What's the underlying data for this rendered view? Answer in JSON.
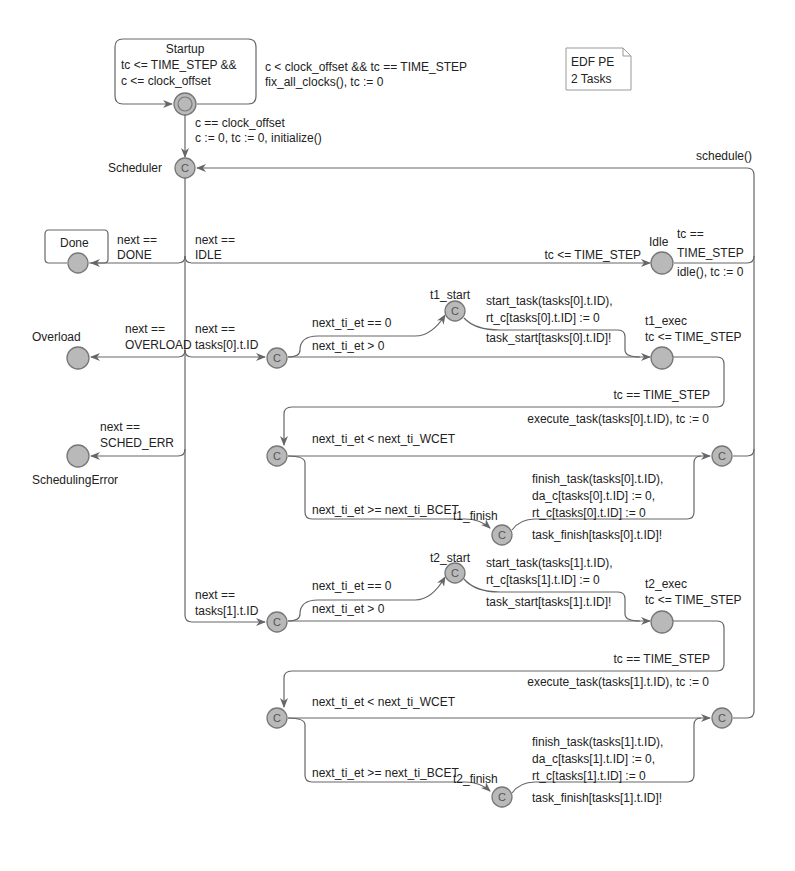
{
  "note": {
    "line1": "EDF PE",
    "line2": "2 Tasks"
  },
  "locations": {
    "startup": {
      "name": "Startup",
      "inv1": "tc <= TIME_STEP &&",
      "inv2": "c <= clock_offset"
    },
    "scheduler": {
      "name": "Scheduler",
      "mark": "C"
    },
    "done": {
      "name": "Done"
    },
    "idle": {
      "name": "Idle"
    },
    "overload": {
      "name": "Overload"
    },
    "sched_error": {
      "name": "SchedulingError"
    },
    "t1_start": {
      "name": "t1_start",
      "mark": "C"
    },
    "t1_exec": {
      "name": "t1_exec",
      "inv": "tc <= TIME_STEP"
    },
    "t1_finish": {
      "name": "t1_finish",
      "mark": "C"
    },
    "t2_start": {
      "name": "t2_start",
      "mark": "C"
    },
    "t2_exec": {
      "name": "t2_exec",
      "inv": "tc <= TIME_STEP"
    },
    "t2_finish": {
      "name": "t2_finish",
      "mark": "C"
    },
    "committed_mark": "C"
  },
  "edges": {
    "startup_self": {
      "guard": "c < clock_offset && tc == TIME_STEP",
      "update": "fix_all_clocks(), tc := 0"
    },
    "startup_to_sched": {
      "guard": "c == clock_offset",
      "update": "c := 0, tc := 0, initialize()"
    },
    "return_sched": {
      "update": "schedule()"
    },
    "to_done": {
      "g1": "next ==",
      "g2": "DONE"
    },
    "to_idle": {
      "g1": "next ==",
      "g2": "IDLE"
    },
    "idle_inv": "tc <= TIME_STEP",
    "idle_out": {
      "g1": "tc ==",
      "g2": "TIME_STEP",
      "update": "idle(), tc := 0"
    },
    "to_overload": {
      "g1": "next ==",
      "g2": "OVERLOAD"
    },
    "to_sched_err": {
      "g1": "next ==",
      "g2": "SCHED_ERR"
    },
    "task0": {
      "select": {
        "g1": "next ==",
        "g2": "tasks[0].t.ID"
      },
      "et_zero": "next_ti_et == 0",
      "et_pos": "next_ti_et > 0",
      "start_u1": "start_task(tasks[0].t.ID),",
      "start_u2": "rt_c[tasks[0].t.ID] := 0",
      "start_sync": "task_start[tasks[0].t.ID]!",
      "exec_guard": "tc == TIME_STEP",
      "exec_update": "execute_task(tasks[0].t.ID), tc := 0",
      "lt_wcet": "next_ti_et < next_ti_WCET",
      "ge_bcet": "next_ti_et >= next_ti_BCET",
      "fin_u1": "finish_task(tasks[0].t.ID),",
      "fin_u2": "da_c[tasks[0].t.ID] := 0,",
      "fin_u3": "rt_c[tasks[0].t.ID] := 0",
      "fin_sync": "task_finish[tasks[0].t.ID]!"
    },
    "task1": {
      "select": {
        "g1": "next ==",
        "g2": "tasks[1].t.ID"
      },
      "et_zero": "next_ti_et == 0",
      "et_pos": "next_ti_et > 0",
      "start_u1": "start_task(tasks[1].t.ID),",
      "start_u2": "rt_c[tasks[1].t.ID] := 0",
      "start_sync": "task_start[tasks[1].t.ID]!",
      "exec_guard": "tc == TIME_STEP",
      "exec_update": "execute_task(tasks[1].t.ID), tc := 0",
      "lt_wcet": "next_ti_et < next_ti_WCET",
      "ge_bcet": "next_ti_et >= next_ti_BCET",
      "fin_u1": "finish_task(tasks[1].t.ID),",
      "fin_u2": "da_c[tasks[1].t.ID] := 0,",
      "fin_u3": "rt_c[tasks[1].t.ID] := 0",
      "fin_sync": "task_finish[tasks[1].t.ID]!"
    }
  }
}
